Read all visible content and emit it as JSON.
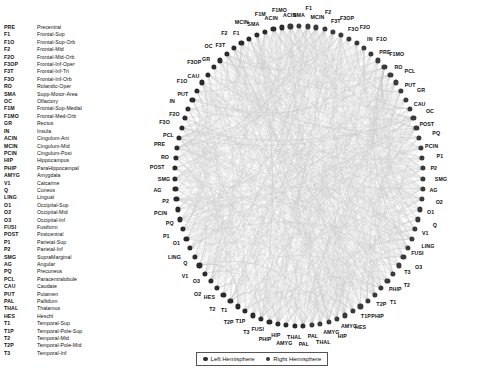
{
  "legend": {
    "abbreviations": [
      {
        "key": "PRE",
        "name": "Precentral"
      },
      {
        "key": "F1",
        "name": "Frontal-Sup"
      },
      {
        "key": "F1O",
        "name": "Frontal-Sup-Orb"
      },
      {
        "key": "F2",
        "name": "Frontal-Mid"
      },
      {
        "key": "F2O",
        "name": "Frontal-Mid-Orb"
      },
      {
        "key": "F3OP",
        "name": "Frontal-Inf-Oper"
      },
      {
        "key": "F3T",
        "name": "Frontal-Inf-Tri"
      },
      {
        "key": "F3O",
        "name": "Frontal-Inf-Orb"
      },
      {
        "key": "RO",
        "name": "Rolandic-Oper"
      },
      {
        "key": "SMA",
        "name": "Supp-Motor-Area"
      },
      {
        "key": "OC",
        "name": "Olfactory"
      },
      {
        "key": "F1M",
        "name": "Frontal-Sup-Medial"
      },
      {
        "key": "F1MO",
        "name": "Frontal-Med-Orb"
      },
      {
        "key": "GR",
        "name": "Rectus"
      },
      {
        "key": "IN",
        "name": "Insula"
      },
      {
        "key": "ACIN",
        "name": "Cingulum-Ant"
      },
      {
        "key": "MCIN",
        "name": "Cingulum-Mid"
      },
      {
        "key": "PCIN",
        "name": "Cingulum-Post"
      },
      {
        "key": "HIP",
        "name": "Hippocampus"
      },
      {
        "key": "PHIP",
        "name": "ParaHippocampal"
      },
      {
        "key": "AMYG",
        "name": "Amygdala"
      },
      {
        "key": "V1",
        "name": "Calcarine"
      },
      {
        "key": "Q",
        "name": "Cuneus"
      },
      {
        "key": "LING",
        "name": "Lingual"
      },
      {
        "key": "O1",
        "name": "Occipital-Sup"
      },
      {
        "key": "O2",
        "name": "Occipital-Mid"
      },
      {
        "key": "O3",
        "name": "Occipital-Inf"
      },
      {
        "key": "FUSI",
        "name": "Fusiform"
      },
      {
        "key": "POST",
        "name": "Postcentral"
      },
      {
        "key": "P1",
        "name": "Parietal-Sup"
      },
      {
        "key": "P2",
        "name": "Parietal-Inf"
      },
      {
        "key": "SMG",
        "name": "SupraMarginal"
      },
      {
        "key": "AG",
        "name": "Angular"
      },
      {
        "key": "PQ",
        "name": "Precuneus"
      },
      {
        "key": "PCL",
        "name": "Paracentralobule"
      },
      {
        "key": "CAU",
        "name": "Caudate"
      },
      {
        "key": "PUT",
        "name": "Putamen"
      },
      {
        "key": "PAL",
        "name": "Pallidum"
      },
      {
        "key": "THAL",
        "name": "Thalamus"
      },
      {
        "key": "HES",
        "name": "Heschl"
      },
      {
        "key": "T1",
        "name": "Temporal-Sup"
      },
      {
        "key": "T1P",
        "name": "Temporal-Pole-Sup"
      },
      {
        "key": "T2",
        "name": "Temporal-Mid"
      },
      {
        "key": "T2P",
        "name": "Temporal-Pole-Mid"
      },
      {
        "key": "T3",
        "name": "Temporal-Inf"
      }
    ],
    "hemispheres": [
      {
        "label": "Left Hemisphere",
        "color": "#2b2b2b"
      },
      {
        "label": "Right Hemisphere",
        "color": "#3a3a3a"
      }
    ]
  },
  "chart_data": {
    "type": "graph",
    "layout": "circular",
    "title": "",
    "node_color_left": "#2b2b2b",
    "node_color_right": "#3a3a3a",
    "edge_color": "#c9c9c9",
    "node_count": 90,
    "nodes_clockwise_from_top": [
      {
        "label": "SMA",
        "hemisphere": "right"
      },
      {
        "label": "F1",
        "hemisphere": "right"
      },
      {
        "label": "MCIN",
        "hemisphere": "right"
      },
      {
        "label": "F2",
        "hemisphere": "right"
      },
      {
        "label": "F3T",
        "hemisphere": "right"
      },
      {
        "label": "F3OP",
        "hemisphere": "right"
      },
      {
        "label": "F3O",
        "hemisphere": "right"
      },
      {
        "label": "F2O",
        "hemisphere": "right"
      },
      {
        "label": "IN",
        "hemisphere": "right"
      },
      {
        "label": "F1O",
        "hemisphere": "right"
      },
      {
        "label": "PRE",
        "hemisphere": "right"
      },
      {
        "label": "F1MO",
        "hemisphere": "right"
      },
      {
        "label": "RO",
        "hemisphere": "right"
      },
      {
        "label": "PCL",
        "hemisphere": "right"
      },
      {
        "label": "PUT",
        "hemisphere": "right"
      },
      {
        "label": "GR",
        "hemisphere": "right"
      },
      {
        "label": "CAU",
        "hemisphere": "right"
      },
      {
        "label": "OC",
        "hemisphere": "right"
      },
      {
        "label": "POST",
        "hemisphere": "right"
      },
      {
        "label": "PQ",
        "hemisphere": "right"
      },
      {
        "label": "PCIN",
        "hemisphere": "right"
      },
      {
        "label": "P1",
        "hemisphere": "right"
      },
      {
        "label": "P2",
        "hemisphere": "right"
      },
      {
        "label": "SMG",
        "hemisphere": "right"
      },
      {
        "label": "AG",
        "hemisphere": "right"
      },
      {
        "label": "O2",
        "hemisphere": "right"
      },
      {
        "label": "O1",
        "hemisphere": "right"
      },
      {
        "label": "Q",
        "hemisphere": "right"
      },
      {
        "label": "V1",
        "hemisphere": "right"
      },
      {
        "label": "LING",
        "hemisphere": "right"
      },
      {
        "label": "FUSI",
        "hemisphere": "right"
      },
      {
        "label": "O3",
        "hemisphere": "right"
      },
      {
        "label": "T3",
        "hemisphere": "right"
      },
      {
        "label": "T2",
        "hemisphere": "right"
      },
      {
        "label": "PHIP",
        "hemisphere": "right"
      },
      {
        "label": "T1",
        "hemisphere": "right"
      },
      {
        "label": "T2P",
        "hemisphere": "right"
      },
      {
        "label": "PHIP",
        "hemisphere": "right"
      },
      {
        "label": "T1P",
        "hemisphere": "right"
      },
      {
        "label": "HES",
        "hemisphere": "right"
      },
      {
        "label": "AMYG",
        "hemisphere": "right"
      },
      {
        "label": "HIP",
        "hemisphere": "right"
      },
      {
        "label": "AMYG",
        "hemisphere": "right"
      },
      {
        "label": "THAL",
        "hemisphere": "right"
      },
      {
        "label": "PAL",
        "hemisphere": "right"
      },
      {
        "label": "PAL",
        "hemisphere": "left"
      },
      {
        "label": "THAL",
        "hemisphere": "left"
      },
      {
        "label": "AMYG",
        "hemisphere": "left"
      },
      {
        "label": "HIP",
        "hemisphere": "left"
      },
      {
        "label": "PHIP",
        "hemisphere": "left"
      },
      {
        "label": "FUSI",
        "hemisphere": "left"
      },
      {
        "label": "T3",
        "hemisphere": "left"
      },
      {
        "label": "T1P",
        "hemisphere": "left"
      },
      {
        "label": "T2P",
        "hemisphere": "left"
      },
      {
        "label": "T1",
        "hemisphere": "left"
      },
      {
        "label": "T2",
        "hemisphere": "left"
      },
      {
        "label": "HES",
        "hemisphere": "left"
      },
      {
        "label": "O2",
        "hemisphere": "left"
      },
      {
        "label": "O3",
        "hemisphere": "left"
      },
      {
        "label": "V1",
        "hemisphere": "left"
      },
      {
        "label": "Q",
        "hemisphere": "left"
      },
      {
        "label": "LING",
        "hemisphere": "left"
      },
      {
        "label": "O1",
        "hemisphere": "left"
      },
      {
        "label": "P1",
        "hemisphere": "left"
      },
      {
        "label": "PQ",
        "hemisphere": "left"
      },
      {
        "label": "PCIN",
        "hemisphere": "left"
      },
      {
        "label": "P2",
        "hemisphere": "left"
      },
      {
        "label": "AG",
        "hemisphere": "left"
      },
      {
        "label": "SMG",
        "hemisphere": "left"
      },
      {
        "label": "POST",
        "hemisphere": "left"
      },
      {
        "label": "RO",
        "hemisphere": "left"
      },
      {
        "label": "PRE",
        "hemisphere": "left"
      },
      {
        "label": "PCL",
        "hemisphere": "left"
      },
      {
        "label": "F3O",
        "hemisphere": "left"
      },
      {
        "label": "F2O",
        "hemisphere": "left"
      },
      {
        "label": "IN",
        "hemisphere": "left"
      },
      {
        "label": "PUT",
        "hemisphere": "left"
      },
      {
        "label": "F1O",
        "hemisphere": "left"
      },
      {
        "label": "CAU",
        "hemisphere": "left"
      },
      {
        "label": "F3OP",
        "hemisphere": "left"
      },
      {
        "label": "GR",
        "hemisphere": "left"
      },
      {
        "label": "OC",
        "hemisphere": "left"
      },
      {
        "label": "F3T",
        "hemisphere": "left"
      },
      {
        "label": "F2",
        "hemisphere": "left"
      },
      {
        "label": "F1",
        "hemisphere": "left"
      },
      {
        "label": "MCIN",
        "hemisphere": "left"
      },
      {
        "label": "SMA",
        "hemisphere": "left"
      },
      {
        "label": "F1M",
        "hemisphere": "left"
      },
      {
        "label": "ACIN",
        "hemisphere": "left"
      },
      {
        "label": "F1MO",
        "hemisphere": "left"
      },
      {
        "label": "ACIN",
        "hemisphere": "right"
      }
    ]
  }
}
